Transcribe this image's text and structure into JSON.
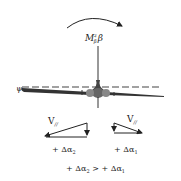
{
  "diagram": {
    "moment_label": {
      "base": "M",
      "sup": "z",
      "sub": "β",
      "suffix": "β"
    },
    "angle_label": "ψ",
    "left_triangle": {
      "velocity_label": "V",
      "velocity_sub": "//",
      "delta_label": "+ Δα",
      "delta_sub": "2"
    },
    "right_triangle": {
      "velocity_label": "V",
      "velocity_sub": "//",
      "delta_label": "+ Δα",
      "delta_sub": "1"
    },
    "comparison": {
      "left": "+ Δα",
      "left_sub": "2",
      "op": " > ",
      "right": "+ Δα",
      "right_sub": "1"
    },
    "colors": {
      "stroke": "#222222",
      "aircraft": "#555555",
      "dashed": "#444444"
    }
  }
}
